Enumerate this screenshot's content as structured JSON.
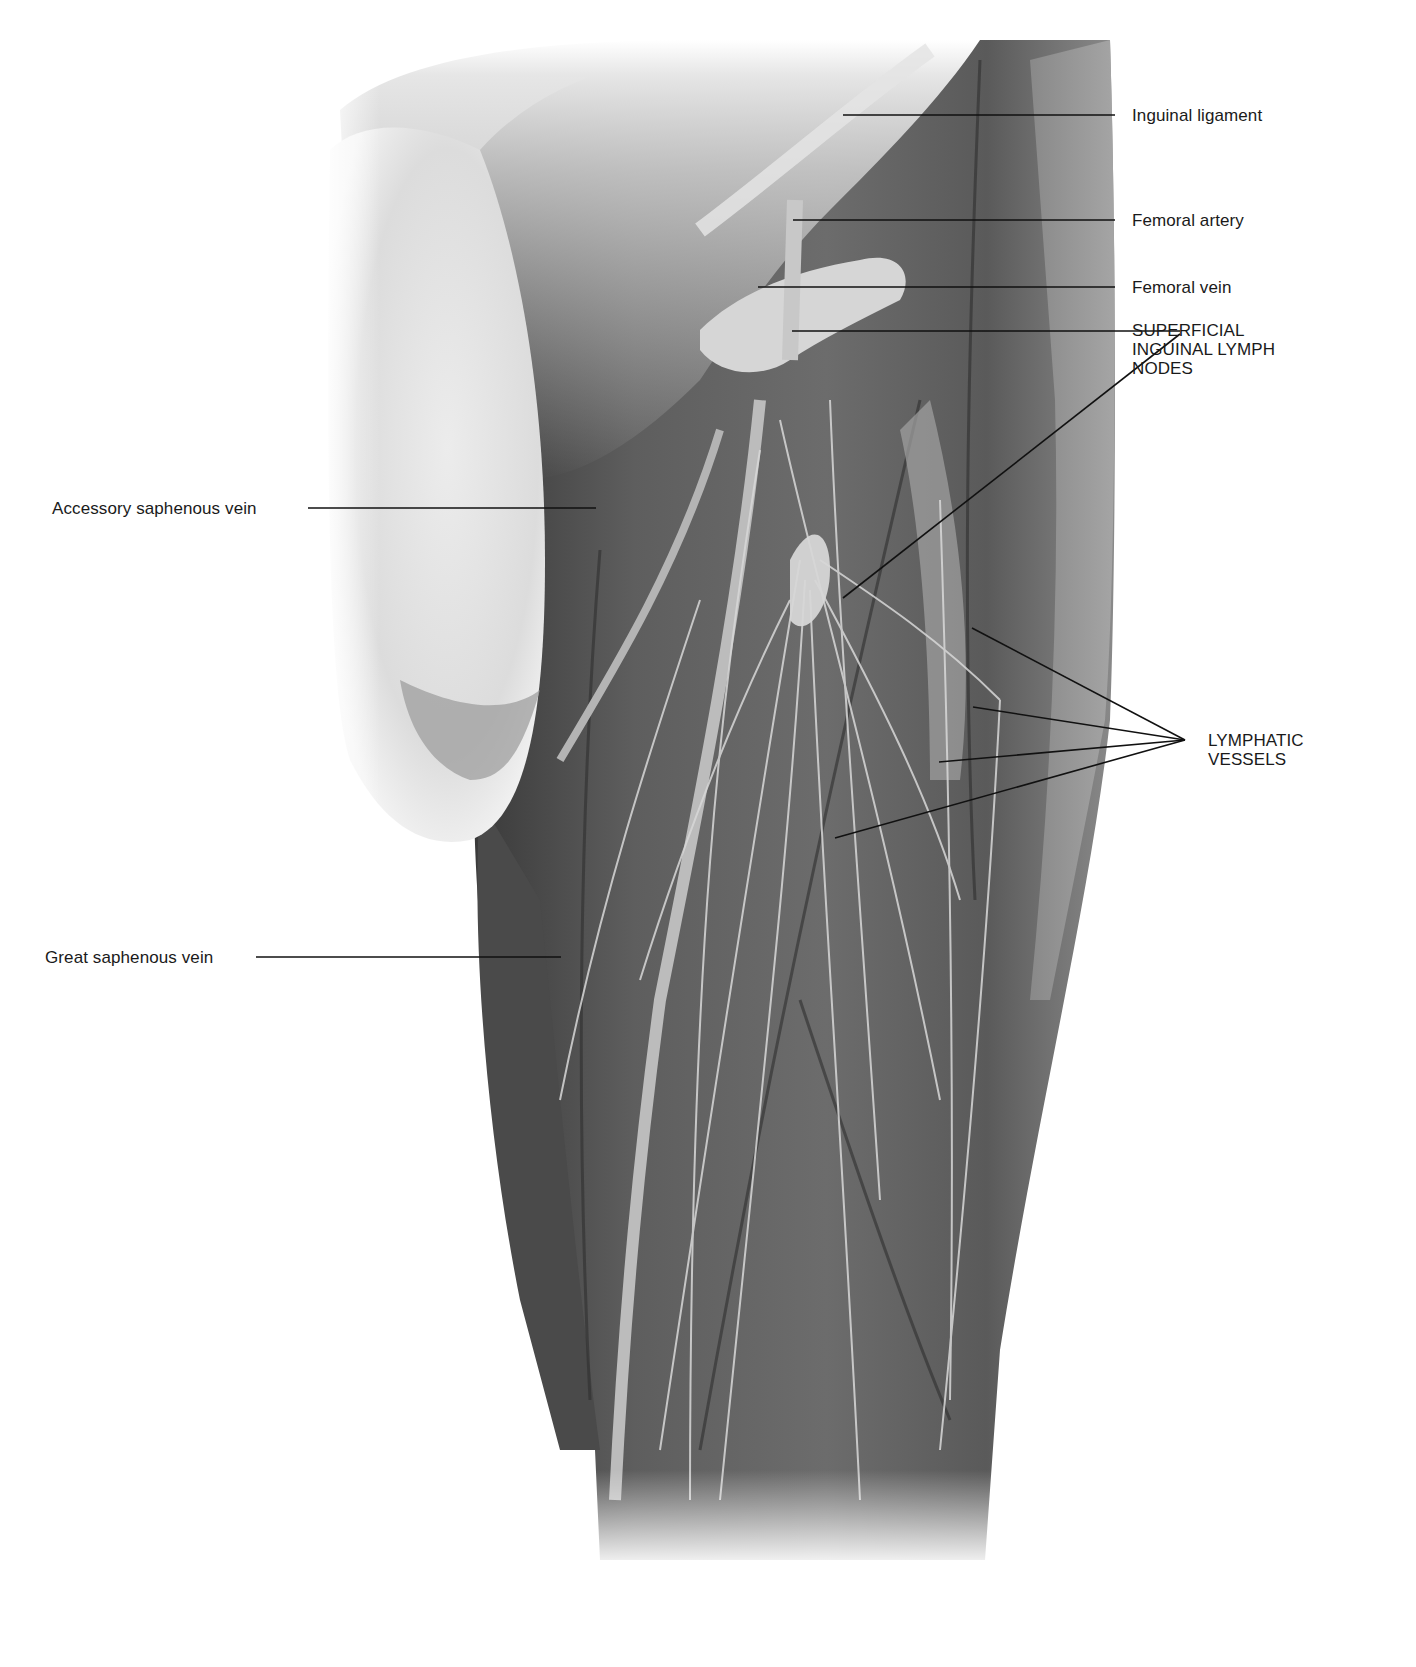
{
  "figure": {
    "palette": {
      "background": "#ffffff",
      "skin_light": "#e2e2e2",
      "fascia": "#bdbdbd",
      "muscle_mid": "#6f6f6f",
      "muscle_dark": "#404040",
      "vessel": "#cfcfcf",
      "leader_line": "#111111",
      "label_text": "#1a1a1a"
    }
  },
  "labels": {
    "right": [
      {
        "id": "inguinal-ligament",
        "text": "Inguinal ligament"
      },
      {
        "id": "femoral-artery",
        "text": "Femoral artery"
      },
      {
        "id": "femoral-vein",
        "text": "Femoral vein"
      },
      {
        "id": "superficial-inguinal-lymph-nodes",
        "text": "SUPERFICIAL\nINGUINAL LYMPH\nNODES"
      },
      {
        "id": "lymphatic-vessels",
        "text": "LYMPHATIC\nVESSELS"
      }
    ],
    "left": [
      {
        "id": "accessory-saphenous-vein",
        "text": "Accessory saphenous vein"
      },
      {
        "id": "great-saphenous-vein",
        "text": "Great saphenous vein"
      }
    ]
  }
}
